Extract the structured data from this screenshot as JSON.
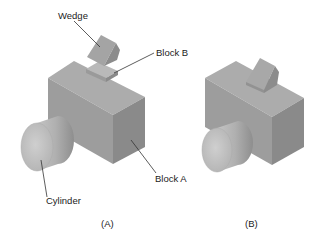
{
  "figure": {
    "panels": [
      {
        "caption": "(A)",
        "labels": {
          "wedge": "Wedge",
          "block_b": "Block B",
          "block_a": "Block A",
          "cylinder": "Cylinder"
        }
      },
      {
        "caption": "(B)"
      }
    ],
    "colors": {
      "top_face": "#a9a9a9",
      "left_face": "#9a9a9a",
      "right_face": "#8a8a8a",
      "cylinder_face": "#bdbdbd",
      "cylinder_side": "#a5a5a5",
      "leader_line": "#333333",
      "text": "#222222"
    }
  }
}
